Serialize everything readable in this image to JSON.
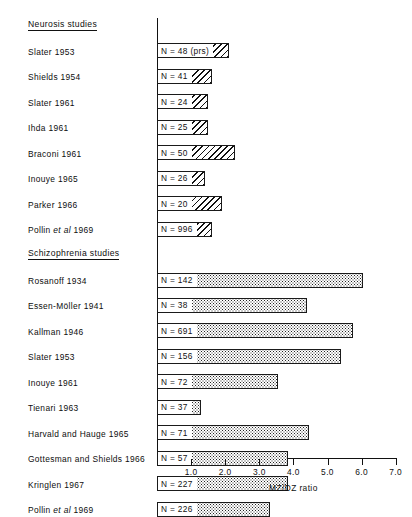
{
  "chart_data": {
    "type": "bar",
    "orientation": "horizontal",
    "title": "",
    "xlabel": "MZ/DZ ratio",
    "ylabel": "",
    "xlim": [
      0,
      7.0
    ],
    "xticks": [
      1.0,
      2.0,
      3.0,
      4.0,
      5.0,
      6.0,
      7.0
    ],
    "xticklabels": [
      "1.0",
      "2.0",
      "3.0",
      "4.0",
      "5.0",
      "6.0",
      "7.0"
    ],
    "grid": false,
    "legend": null,
    "groups": [
      {
        "name": "Neurosis studies",
        "fill": "diagonal-hatch",
        "categories": [
          "Slater 1953",
          "Shields 1954",
          "Slater 1961",
          "Ihda 1961",
          "Braconi 1961",
          "Inouye 1965",
          "Parker 1966",
          "Pollin et al 1969"
        ],
        "values": [
          2.1,
          1.6,
          1.5,
          1.5,
          2.3,
          1.4,
          1.9,
          1.6
        ],
        "annotations": [
          "N = 48 (prs)",
          "N = 41",
          "N = 24",
          "N = 25",
          "N = 50",
          "N = 26",
          "N = 20",
          "N = 996"
        ]
      },
      {
        "name": "Schizophrenia studies",
        "fill": "stipple",
        "categories": [
          "Rosanoff 1934",
          "Essen-Möller 1941",
          "Kallman 1946",
          "Slater 1953",
          "Inouye 1961",
          "Tienari 1963",
          "Harvald and Hauge 1965",
          "Gottesman and Shields 1966",
          "Kringlen 1967",
          "Pollin et al 1969"
        ],
        "values": [
          6.05,
          4.4,
          5.75,
          5.4,
          3.55,
          1.3,
          4.45,
          3.85,
          3.85,
          3.3
        ],
        "annotations": [
          "N = 142",
          "N = 38",
          "N = 691",
          "N = 156",
          "N = 72",
          "N = 37",
          "N = 71",
          "N = 57",
          "N = 227",
          "N = 226"
        ]
      }
    ]
  },
  "rows": [
    {
      "kind": "head",
      "label": "Neurosis studies"
    },
    {
      "kind": "bar",
      "label": "Slater 1953",
      "italic_word": null,
      "n": "N = 48 (prs)",
      "v": 2.1,
      "fill": "hatch"
    },
    {
      "kind": "bar",
      "label": "Shields 1954",
      "italic_word": null,
      "n": "N = 41",
      "v": 1.6,
      "fill": "hatch"
    },
    {
      "kind": "bar",
      "label": "Slater 1961",
      "italic_word": null,
      "n": "N = 24",
      "v": 1.5,
      "fill": "hatch"
    },
    {
      "kind": "bar",
      "label": "Ihda 1961",
      "italic_word": null,
      "n": "N = 25",
      "v": 1.5,
      "fill": "hatch"
    },
    {
      "kind": "bar",
      "label": "Braconi 1961",
      "italic_word": null,
      "n": "N = 50",
      "v": 2.3,
      "fill": "hatch"
    },
    {
      "kind": "bar",
      "label": "Inouye 1965",
      "italic_word": null,
      "n": "N = 26",
      "v": 1.4,
      "fill": "hatch"
    },
    {
      "kind": "bar",
      "label": "Parker 1966",
      "italic_word": null,
      "n": "N = 20",
      "v": 1.9,
      "fill": "hatch"
    },
    {
      "kind": "bar",
      "label": "Pollin et al 1969",
      "italic_word": "et al",
      "n": "N = 996",
      "v": 1.6,
      "fill": "hatch"
    },
    {
      "kind": "head",
      "label": "Schizophrenia studies"
    },
    {
      "kind": "bar",
      "label": "Rosanoff 1934",
      "italic_word": null,
      "n": "N = 142",
      "v": 6.05,
      "fill": "stipple"
    },
    {
      "kind": "bar",
      "label": "Essen-Möller 1941",
      "italic_word": null,
      "n": "N = 38",
      "v": 4.4,
      "fill": "stipple"
    },
    {
      "kind": "bar",
      "label": "Kallman 1946",
      "italic_word": null,
      "n": "N = 691",
      "v": 5.75,
      "fill": "stipple"
    },
    {
      "kind": "bar",
      "label": "Slater 1953",
      "italic_word": null,
      "n": "N = 156",
      "v": 5.4,
      "fill": "stipple"
    },
    {
      "kind": "bar",
      "label": "Inouye 1961",
      "italic_word": null,
      "n": "N = 72",
      "v": 3.55,
      "fill": "stipple"
    },
    {
      "kind": "bar",
      "label": "Tienari 1963",
      "italic_word": null,
      "n": "N = 37",
      "v": 1.3,
      "fill": "stipple"
    },
    {
      "kind": "bar",
      "label": "Harvald and Hauge 1965",
      "italic_word": null,
      "n": "N = 71",
      "v": 4.45,
      "fill": "stipple"
    },
    {
      "kind": "bar",
      "label": "Gottesman and Shields 1966",
      "italic_word": null,
      "n": "N = 57",
      "v": 3.85,
      "fill": "stipple"
    },
    {
      "kind": "bar",
      "label": "Kringlen 1967",
      "italic_word": null,
      "n": "N = 227",
      "v": 3.85,
      "fill": "stipple"
    },
    {
      "kind": "bar",
      "label": "Pollin et al 1969",
      "italic_word": "et al",
      "n": "N = 226",
      "v": 3.3,
      "fill": "stipple"
    }
  ],
  "axis": {
    "x_title": "MZ/DZ ratio",
    "ticks": [
      "1.0",
      "2.0",
      "3.0",
      "4.0",
      "5.0",
      "6.0",
      "7.0"
    ]
  },
  "colors": {
    "ink": "#111111",
    "paper": "#ffffff"
  }
}
